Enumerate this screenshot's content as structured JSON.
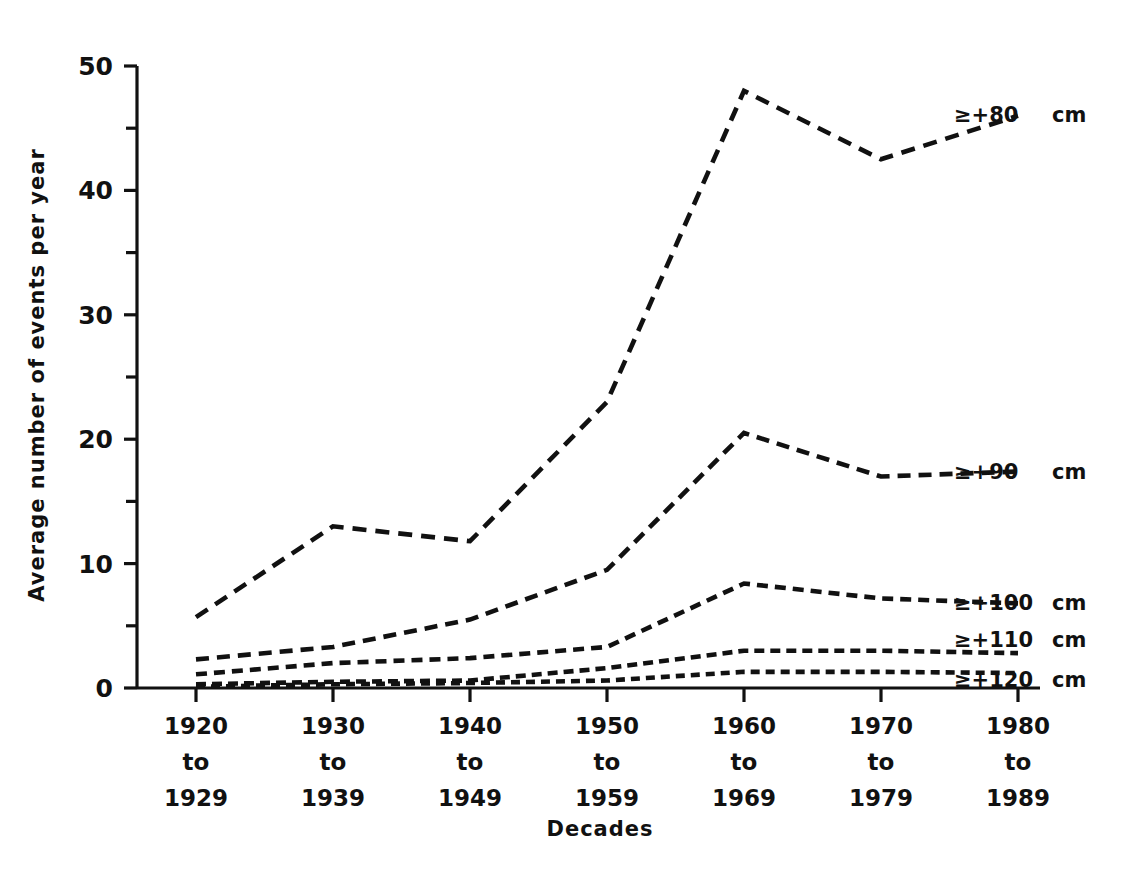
{
  "header": {
    "running_head": "CASE HISTORIES"
  },
  "chart_data": {
    "type": "line",
    "title": "",
    "xlabel": "Decades",
    "ylabel": "Average number of events per year",
    "ylim": [
      0,
      50
    ],
    "yticks": [
      0,
      10,
      20,
      30,
      40,
      50
    ],
    "ytick_labels": [
      "0",
      "10",
      "20",
      "30",
      "40",
      "50"
    ],
    "yminor_ticks": [
      5,
      15,
      25,
      35,
      45
    ],
    "grid": false,
    "legend_position": "right-inline-end-of-line",
    "categories": [
      "1920\nto\n1929",
      "1930\nto\n1939",
      "1940\nto\n1949",
      "1950\nto\n1959",
      "1960\nto\n1969",
      "1970\nto\n1979",
      "1980\nto\n1989"
    ],
    "category_lines": [
      [
        "1920",
        "to",
        "1929"
      ],
      [
        "1930",
        "to",
        "1939"
      ],
      [
        "1940",
        "to",
        "1949"
      ],
      [
        "1950",
        "to",
        "1959"
      ],
      [
        "1960",
        "to",
        "1969"
      ],
      [
        "1970",
        "to",
        "1979"
      ],
      [
        "1980",
        "to",
        "1989"
      ]
    ],
    "series": [
      {
        "name": "≥+80 cm",
        "label": "≥+80",
        "unit": "cm",
        "dash": "14,9",
        "values": [
          5.7,
          13.0,
          11.8,
          23.0,
          48.0,
          42.5,
          46.0
        ]
      },
      {
        "name": "≥+90 cm",
        "label": "≥+90",
        "unit": "cm",
        "dash": "13,8",
        "values": [
          2.3,
          3.3,
          5.5,
          9.5,
          20.5,
          17.0,
          17.4
        ]
      },
      {
        "name": "≥+100 cm",
        "label": "≥+100",
        "unit": "cm",
        "dash": "11,7",
        "values": [
          1.1,
          2.0,
          2.4,
          3.3,
          8.4,
          7.2,
          6.8
        ]
      },
      {
        "name": "≥+110 cm",
        "label": "≥+110",
        "unit": "cm",
        "dash": "10,6",
        "values": [
          0.3,
          0.5,
          0.6,
          1.6,
          3.0,
          3.0,
          2.8
        ]
      },
      {
        "name": "≥+120 cm",
        "label": "≥+120",
        "unit": "cm",
        "dash": "9,6",
        "values": [
          0.1,
          0.3,
          0.4,
          0.6,
          1.3,
          1.3,
          1.2
        ]
      }
    ],
    "colors": {
      "line": "#111111",
      "axis": "#111111",
      "text": "#111111",
      "background": "#ffffff"
    }
  }
}
